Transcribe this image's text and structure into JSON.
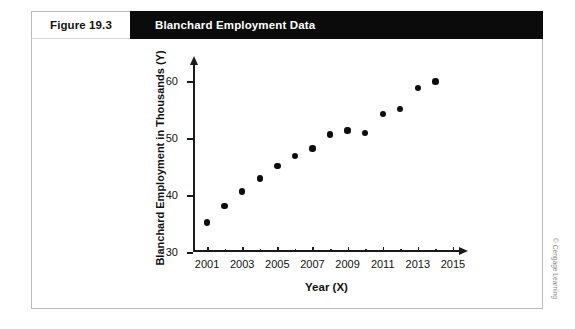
{
  "figure": {
    "number_label": "Figure 19.3",
    "title": "Blanchard Employment Data"
  },
  "credit": "© Cengage Learning",
  "background_text": [
    "Y = 36.49 + 1.72X",
    "s = 0.6  b  1.1, 6",
    "the Bonferroni method a more strin",
    "an assumption.",
    "increases. In this particular example the t",
    "the value of r and show that the 2013 heading",
    "Since a residual is the difference between",
    "from the regression equation, and since the",
    "= 3(A) + 1.72(B)",
    "A Note that the Blanchard a series with",
    "and the data are not independent, the",
    "of the error term in one period is",
    "to the error term in the next period",
    "autocorrelation is present, the standard",
    "errors are biased and the t statistics"
  ],
  "chart_data": {
    "type": "scatter",
    "title": "Blanchard Employment Data",
    "xlabel": "Year (X)",
    "ylabel": "Blanchard Employment in Thousands (Y)",
    "xlim": [
      2000.2,
      2015.4
    ],
    "ylim": [
      30,
      63
    ],
    "grid": false,
    "legend": "none",
    "x_ticks": [
      2001,
      2003,
      2005,
      2007,
      2009,
      2011,
      2013,
      2015
    ],
    "x_minor_ticks": [
      2001,
      2002,
      2003,
      2004,
      2005,
      2006,
      2007,
      2008,
      2009,
      2010,
      2011,
      2012,
      2013,
      2014,
      2015
    ],
    "y_ticks": [
      30,
      40,
      50,
      60
    ],
    "x": [
      2001,
      2002,
      2003,
      2004,
      2005,
      2006,
      2007,
      2008,
      2009,
      2010,
      2011,
      2012,
      2013,
      2014
    ],
    "values": [
      35.2,
      38.1,
      40.6,
      42.9,
      45.1,
      46.8,
      48.2,
      50.6,
      51.3,
      50.9,
      54.2,
      55.1,
      58.8,
      59.9
    ],
    "series": [
      {
        "name": "Blanchard Employment",
        "values": [
          35.2,
          38.1,
          40.6,
          42.9,
          45.1,
          46.8,
          48.2,
          50.6,
          51.3,
          50.9,
          54.2,
          55.1,
          58.8,
          59.9
        ]
      }
    ]
  }
}
